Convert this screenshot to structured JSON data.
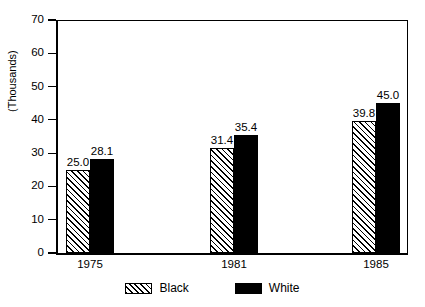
{
  "chart_data": {
    "type": "bar",
    "title": "",
    "subtitle": "",
    "xlabel": "",
    "ylabel": "(Thousands)",
    "categories": [
      "1975",
      "1981",
      "1985"
    ],
    "series": [
      {
        "name": "Black",
        "values": [
          25.0,
          28.1,
          31.4
        ],
        "style": "hatched"
      },
      {
        "name": "White",
        "values": [
          28.1,
          35.4,
          45.0
        ],
        "style": "solid"
      }
    ],
    "groups": [
      {
        "category": "1975",
        "bars": [
          {
            "series": "Black",
            "value": 25.0,
            "label": "25.0",
            "style": "hatched"
          },
          {
            "series": "White",
            "value": 28.1,
            "label": "28.1",
            "style": "solid"
          }
        ]
      },
      {
        "category": "1981",
        "bars": [
          {
            "series": "Black",
            "value": 31.4,
            "label": "31.4",
            "style": "hatched"
          },
          {
            "series": "White",
            "value": 35.4,
            "label": "35.4",
            "style": "solid"
          }
        ]
      },
      {
        "category": "1985",
        "bars": [
          {
            "series": "Black",
            "value": 39.8,
            "label": "39.8",
            "style": "hatched"
          },
          {
            "series": "White",
            "value": 45.0,
            "label": "45.0",
            "style": "solid"
          }
        ]
      }
    ],
    "ylim": [
      0,
      70
    ],
    "yticks": [
      0,
      10,
      20,
      30,
      40,
      50,
      60,
      70
    ],
    "ytick_labels": [
      "0",
      "10",
      "20",
      "30",
      "40",
      "50",
      "60",
      "70"
    ],
    "grid": false,
    "legend_position": "bottom",
    "legend": [
      {
        "label": "Black",
        "style": "hatched"
      },
      {
        "label": "White",
        "style": "solid"
      }
    ],
    "colors": {
      "series_black_fill": "#ffffff",
      "series_black_hatch": "#000000",
      "series_white_fill": "#000000",
      "axis": "#000000",
      "background": "#ffffff",
      "text": "#000000"
    }
  }
}
